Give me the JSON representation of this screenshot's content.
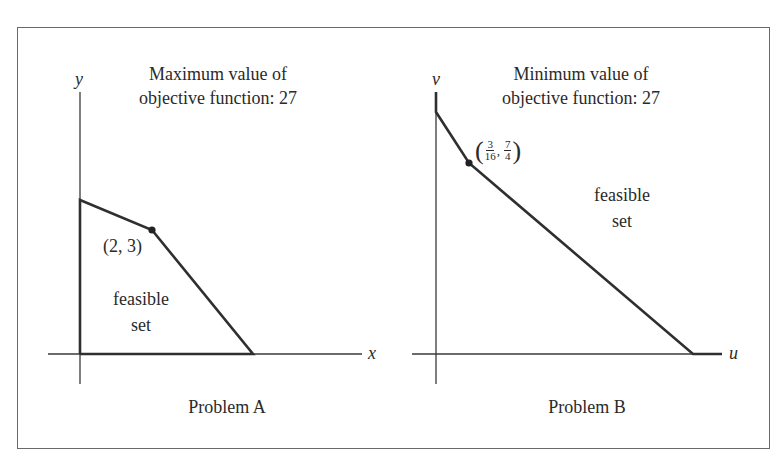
{
  "figure": {
    "panels": [
      {
        "id": "A",
        "caption": "Problem A",
        "title_line1": "Maximum value of",
        "title_line2": "objective function: 27",
        "x_axis_label": "x",
        "y_axis_label": "y",
        "region_label_line1": "feasible",
        "region_label_line2": "set",
        "highlight_point_label": "(2, 3)",
        "highlight_point": {
          "x": "2",
          "y": "3"
        },
        "objective": "maximum",
        "objective_value": 27,
        "colors": {
          "line": "#2f2f2f",
          "axis": "#3a3a3a",
          "point": "#222222"
        }
      },
      {
        "id": "B",
        "caption": "Problem B",
        "title_line1": "Minimum value of",
        "title_line2": "objective function: 27",
        "x_axis_label": "u",
        "y_axis_label": "v",
        "region_label_line1": "feasible",
        "region_label_line2": "set",
        "highlight_point": {
          "u_num": "3",
          "u_den": "16",
          "u_sep": ",",
          "v_num": "7",
          "v_den": "4"
        },
        "highlight_point_label": "(3/16, 7/4)",
        "objective": "minimum",
        "objective_value": 27,
        "colors": {
          "line": "#2f2f2f",
          "axis": "#3a3a3a",
          "point": "#222222"
        }
      }
    ]
  }
}
